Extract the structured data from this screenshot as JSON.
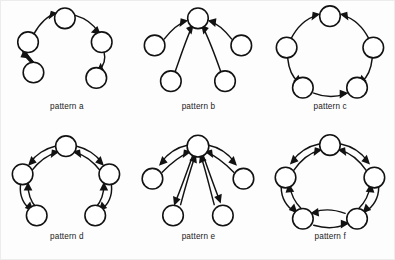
{
  "figure": {
    "type": "diagram",
    "background_color": "#fdfdfd",
    "node_fill": "#ffffff",
    "stroke_color": "#121212",
    "panel_columns": 3,
    "panel_rows": 2
  },
  "panels": [
    {
      "id": "a",
      "caption": "pattern a",
      "layout": "open-ring-chain",
      "node_count": 5,
      "edge_count": 4,
      "bidirectional": false,
      "nodes": [
        {
          "id": "a1",
          "cx": 27,
          "cy": 66
        },
        {
          "id": "a2",
          "cx": 22,
          "cy": 38
        },
        {
          "id": "a3",
          "cx": 56,
          "cy": 16
        },
        {
          "id": "a4",
          "cx": 90,
          "cy": 38
        },
        {
          "id": "a5",
          "cx": 85,
          "cy": 71
        }
      ],
      "edges": [
        {
          "from": "a1",
          "to": "a2"
        },
        {
          "from": "a2",
          "to": "a3"
        },
        {
          "from": "a3",
          "to": "a4"
        },
        {
          "from": "a4",
          "to": "a5"
        }
      ]
    },
    {
      "id": "b",
      "caption": "pattern b",
      "layout": "in-star-hub",
      "node_count": 5,
      "edge_count": 4,
      "bidirectional": false,
      "nodes": [
        {
          "id": "b0",
          "cx": 57,
          "cy": 16,
          "role": "hub"
        },
        {
          "id": "b1",
          "cx": 17,
          "cy": 40
        },
        {
          "id": "b2",
          "cx": 97,
          "cy": 40
        },
        {
          "id": "b3",
          "cx": 32,
          "cy": 74
        },
        {
          "id": "b4",
          "cx": 82,
          "cy": 74
        }
      ],
      "edges": [
        {
          "from": "b1",
          "to": "b0"
        },
        {
          "from": "b2",
          "to": "b0"
        },
        {
          "from": "b3",
          "to": "b0"
        },
        {
          "from": "b4",
          "to": "b0"
        }
      ]
    },
    {
      "id": "c",
      "caption": "pattern c",
      "layout": "ring-directed",
      "node_count": 5,
      "edge_count": 5,
      "bidirectional": false,
      "nodes": [
        {
          "id": "c1",
          "cx": 57,
          "cy": 14
        },
        {
          "id": "c2",
          "cx": 97,
          "cy": 43
        },
        {
          "id": "c3",
          "cx": 82,
          "cy": 82
        },
        {
          "id": "c4",
          "cx": 32,
          "cy": 82
        },
        {
          "id": "c5",
          "cx": 17,
          "cy": 43
        }
      ],
      "edges": [
        {
          "from": "c5",
          "to": "c1"
        },
        {
          "from": "c2",
          "to": "c1"
        },
        {
          "from": "c5",
          "to": "c4"
        },
        {
          "from": "c2",
          "to": "c3"
        },
        {
          "from": "c4",
          "to": "c3"
        }
      ]
    },
    {
      "id": "d",
      "caption": "pattern d",
      "layout": "bidirectional-chain",
      "node_count": 5,
      "edge_count": 4,
      "bidirectional": true,
      "nodes": [
        {
          "id": "d1",
          "cx": 57,
          "cy": 14
        },
        {
          "id": "d2",
          "cx": 97,
          "cy": 40
        },
        {
          "id": "d3",
          "cx": 84,
          "cy": 78
        },
        {
          "id": "d4",
          "cx": 30,
          "cy": 78
        },
        {
          "id": "d5",
          "cx": 17,
          "cy": 40
        }
      ],
      "edges": [
        {
          "from": "d5",
          "to": "d1",
          "bidirectional": true
        },
        {
          "from": "d1",
          "to": "d2",
          "bidirectional": true
        },
        {
          "from": "d5",
          "to": "d4",
          "bidirectional": true
        },
        {
          "from": "d2",
          "to": "d3",
          "bidirectional": true
        }
      ]
    },
    {
      "id": "e",
      "caption": "pattern e",
      "layout": "bidirectional-star-hub",
      "node_count": 5,
      "edge_count": 4,
      "bidirectional": true,
      "nodes": [
        {
          "id": "e0",
          "cx": 57,
          "cy": 14,
          "role": "hub"
        },
        {
          "id": "e1",
          "cx": 15,
          "cy": 44
        },
        {
          "id": "e2",
          "cx": 99,
          "cy": 44
        },
        {
          "id": "e3",
          "cx": 34,
          "cy": 80
        },
        {
          "id": "e4",
          "cx": 80,
          "cy": 80
        }
      ],
      "edges": [
        {
          "from": "e0",
          "to": "e1",
          "bidirectional": true
        },
        {
          "from": "e0",
          "to": "e2",
          "bidirectional": true
        },
        {
          "from": "e0",
          "to": "e3",
          "bidirectional": true
        },
        {
          "from": "e0",
          "to": "e4",
          "bidirectional": true
        }
      ]
    },
    {
      "id": "f",
      "caption": "pattern f",
      "layout": "bidirectional-ring",
      "node_count": 5,
      "edge_count": 5,
      "bidirectional": true,
      "nodes": [
        {
          "id": "f1",
          "cx": 57,
          "cy": 13
        },
        {
          "id": "f2",
          "cx": 98,
          "cy": 43
        },
        {
          "id": "f3",
          "cx": 82,
          "cy": 82
        },
        {
          "id": "f4",
          "cx": 32,
          "cy": 82
        },
        {
          "id": "f5",
          "cx": 16,
          "cy": 43
        }
      ],
      "edges": [
        {
          "from": "f5",
          "to": "f1",
          "bidirectional": true
        },
        {
          "from": "f1",
          "to": "f2",
          "bidirectional": true
        },
        {
          "from": "f2",
          "to": "f3",
          "bidirectional": true
        },
        {
          "from": "f3",
          "to": "f4",
          "bidirectional": true
        },
        {
          "from": "f4",
          "to": "f5",
          "bidirectional": true
        }
      ]
    }
  ],
  "node_radius": 9.5
}
